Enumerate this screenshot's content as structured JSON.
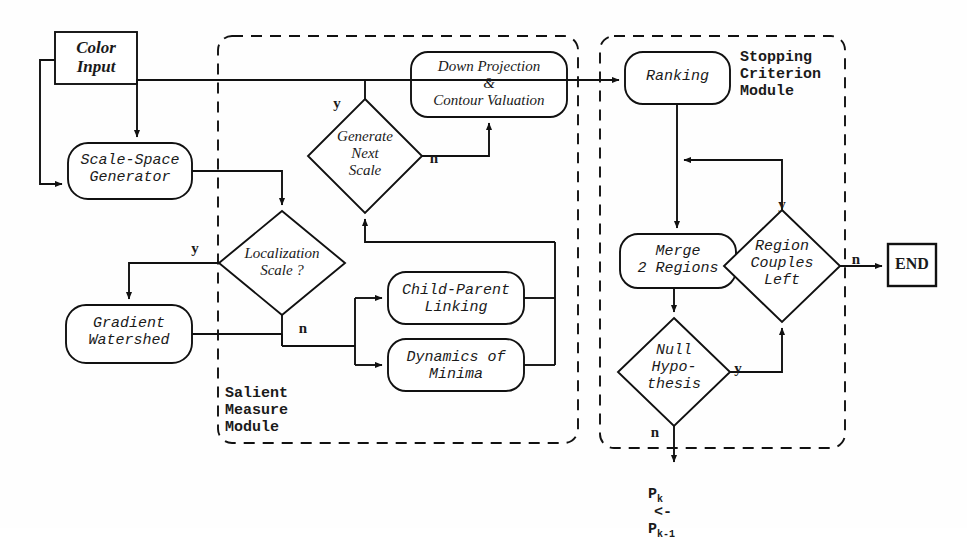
{
  "diagram": {
    "background": "#ffffff",
    "line_color": "#111111"
  },
  "modules": [
    {
      "id": "salient",
      "label": "Salient\nMeasure\nModule",
      "label_lines": [
        "Salient",
        "Measure",
        "Module"
      ],
      "x": 218,
      "y": 36,
      "w": 360,
      "h": 407
    },
    {
      "id": "stopping",
      "label": "Stopping\nCriterion\nModule",
      "label_lines": [
        "Stopping",
        "Criterion",
        "Module"
      ],
      "x": 600,
      "y": 36,
      "w": 245,
      "h": 412
    }
  ],
  "nodes": {
    "color_input": {
      "label": "Color\nInput",
      "shape": "rect",
      "x": 55,
      "y": 32,
      "w": 82,
      "h": 52
    },
    "scale_space": {
      "label": "Scale-Space\nGenerator",
      "shape": "rounded",
      "x": 68,
      "y": 143,
      "w": 124,
      "h": 56
    },
    "localization_scale": {
      "label": "Localization\nScale ?",
      "shape": "diamond",
      "cx": 282,
      "cy": 263,
      "rx": 63,
      "ry": 52
    },
    "gradient_watershed": {
      "label": "Gradient\nWatershed",
      "shape": "rounded",
      "x": 66,
      "y": 305,
      "w": 126,
      "h": 58
    },
    "generate_next_scale": {
      "label": "Generate\nNext\nScale",
      "shape": "diamond",
      "cx": 365,
      "cy": 156,
      "rx": 57,
      "ry": 57
    },
    "down_projection": {
      "label": "Down Projection\n&\nContour Valuation",
      "shape": "rounded",
      "x": 411,
      "y": 52,
      "w": 156,
      "h": 65
    },
    "child_parent": {
      "label": "Child-Parent\nLinking",
      "shape": "rounded",
      "x": 388,
      "y": 272,
      "w": 136,
      "h": 52
    },
    "dynamics_minima": {
      "label": "Dynamics of\nMinima",
      "shape": "rounded",
      "x": 388,
      "y": 339,
      "w": 136,
      "h": 52
    },
    "ranking": {
      "label": "Ranking",
      "shape": "rounded",
      "x": 625,
      "y": 52,
      "w": 105,
      "h": 52
    },
    "merge_regions": {
      "label": "Merge\n2 Regions",
      "shape": "rounded",
      "x": 620,
      "y": 234,
      "w": 116,
      "h": 54
    },
    "region_couples": {
      "label": "Region\nCouples\nLeft",
      "shape": "diamond",
      "cx": 782,
      "cy": 266,
      "rx": 58,
      "ry": 56
    },
    "null_hypothesis": {
      "label": "Null\nHypo-\nthesis",
      "shape": "diamond",
      "cx": 674,
      "cy": 372,
      "rx": 56,
      "ry": 54
    },
    "end": {
      "label": "END",
      "shape": "rect",
      "x": 888,
      "y": 244,
      "w": 48,
      "h": 42
    }
  },
  "branch_labels": [
    {
      "id": "localization-yes",
      "text": "y",
      "x": 188,
      "y": 240
    },
    {
      "id": "localization-no",
      "text": "n",
      "x": 296,
      "y": 320
    },
    {
      "id": "generate-yes",
      "text": "y",
      "x": 330,
      "y": 95
    },
    {
      "id": "generate-no",
      "text": "n",
      "x": 427,
      "y": 150
    },
    {
      "id": "region-couples-yes",
      "text": "y",
      "x": 775,
      "y": 196
    },
    {
      "id": "region-couples-no",
      "text": "n",
      "x": 849,
      "y": 251
    },
    {
      "id": "null-hypothesis-yes",
      "text": "y",
      "x": 731,
      "y": 360
    },
    {
      "id": "null-hypothesis-no",
      "text": "n",
      "x": 648,
      "y": 424
    }
  ],
  "formula": {
    "base1": "P",
    "sub1": "k",
    "op": "<-",
    "base2": "P",
    "sub2": "k-1",
    "x": 612,
    "y": 478
  }
}
